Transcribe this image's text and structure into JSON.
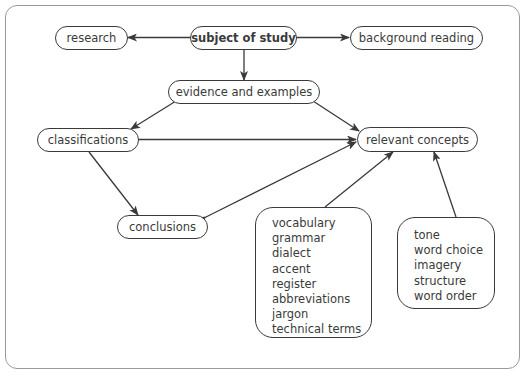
{
  "diagram": {
    "nodes": {
      "subject": "subject of study",
      "research": "research",
      "background": "background reading",
      "evidence": "evidence and examples",
      "classifications": "classifications",
      "concepts": "relevant concepts",
      "conclusions": "conclusions"
    },
    "language_features": [
      "vocabulary",
      "grammar",
      "dialect",
      "accent",
      "register",
      "abbreviations",
      "jargon",
      "technical terms"
    ],
    "style_features": [
      "tone",
      "word choice",
      "imagery",
      "structure",
      "word order"
    ],
    "edges": [
      {
        "from": "subject of study",
        "to": "research"
      },
      {
        "from": "subject of study",
        "to": "background reading"
      },
      {
        "from": "subject of study",
        "to": "evidence and examples"
      },
      {
        "from": "evidence and examples",
        "to": "classifications"
      },
      {
        "from": "evidence and examples",
        "to": "relevant concepts"
      },
      {
        "from": "classifications",
        "to": "relevant concepts",
        "bidirectional": true
      },
      {
        "from": "classifications",
        "to": "conclusions"
      },
      {
        "from": "relevant concepts",
        "to": "conclusions",
        "bidirectional": true
      },
      {
        "from": "language features box",
        "to": "relevant concepts"
      },
      {
        "from": "style features box",
        "to": "relevant concepts"
      }
    ],
    "colors": {
      "stroke": "#3a3a3a",
      "frame": "#9a9a9a",
      "text": "#3a3a3a"
    }
  }
}
